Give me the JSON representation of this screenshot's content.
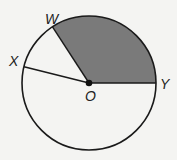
{
  "diagram": {
    "type": "circle-sectors",
    "center": {
      "label": "O",
      "x": 89,
      "y": 83
    },
    "radius": 67,
    "points": [
      {
        "label": "W",
        "angle_deg": 123
      },
      {
        "label": "X",
        "angle_deg": 166
      },
      {
        "label": "Y",
        "angle_deg": 0
      }
    ],
    "shaded_sector": {
      "from": "Y",
      "to": "W",
      "color": "#7a7a7a"
    },
    "colors": {
      "stroke": "#1a1a1a",
      "background": "#f4f4f2",
      "shade": "#7a7a7a"
    }
  },
  "labels": {
    "W": "W",
    "X": "X",
    "Y": "Y",
    "O": "O"
  }
}
